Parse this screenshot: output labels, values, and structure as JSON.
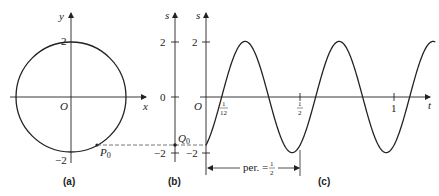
{
  "panels": {
    "a": {
      "caption": "(a)",
      "x_axis_label": "x",
      "y_axis_label": "y",
      "origin_label": "O",
      "tick_top": "2",
      "tick_bottom": "−2",
      "point_label": "P",
      "point_sub": "0"
    },
    "b": {
      "caption": "(b)",
      "axis_label": "s",
      "tick_top": "2",
      "tick_zero": "0",
      "tick_bottom": "−2",
      "point_label": "Q",
      "point_sub": "0"
    },
    "c": {
      "caption": "(c)",
      "axis_label_s": "s",
      "axis_label_t": "t",
      "origin_label": "O",
      "tick_top": "2",
      "tick_bottom": "−2",
      "tick_1_12_num": "1",
      "tick_1_12_den": "12",
      "tick_half_num": "1",
      "tick_half_den": "2",
      "tick_one": "1",
      "period_label": "per. =",
      "period_num": "1",
      "period_den": "2"
    }
  },
  "chart_data": {
    "type": "line",
    "title": "",
    "xlabel": "t",
    "ylabel": "s",
    "function": "s = 2 sin(4π(t − 1/12))",
    "amplitude": 2,
    "period": 0.5,
    "phase_zero_crossing": 0.0833,
    "initial_value": -1.73,
    "x_ticks": [
      "1/12",
      "1/2",
      "1"
    ],
    "y_ticks": [
      2,
      -2
    ],
    "xlim": [
      0,
      1.22
    ],
    "ylim": [
      -2,
      2
    ],
    "annotations": [
      "per. = 1/2",
      "Q0",
      "P0"
    ],
    "circle_radius": 2
  }
}
